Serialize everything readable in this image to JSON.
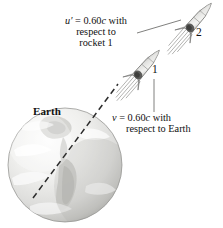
{
  "figure": {
    "background_color": "#ffffff",
    "width": 223,
    "height": 228
  },
  "labels": {
    "u_prime": {
      "line1_symbol": "u′",
      "line1": "u′ = 0.60c with",
      "line2": "respect to",
      "line3": "rocket 1",
      "full_text": "u′ = 0.60c with respect to rocket 1",
      "speed_value": "0.60c"
    },
    "v": {
      "line1": "v = 0.60c with",
      "line2": "respect to Earth",
      "full_text": "v = 0.60c with respect to Earth",
      "speed_value": "0.60c"
    },
    "earth": "Earth",
    "rocket1_number": "1",
    "rocket2_number": "2"
  },
  "objects": {
    "earth": {
      "name": "earth-sphere",
      "fill_light": "#f6f6f5",
      "fill_mid": "#dcdcda",
      "fill_shadow": "#bdbdbb",
      "outline_color": "#8c8c8a"
    },
    "rocket1": {
      "name": "rocket-1",
      "body_color": "#e8e8e6",
      "outline_color": "#6f6f6d",
      "nose_color": "#5c5c5a"
    },
    "rocket2": {
      "name": "rocket-2",
      "body_color": "#e8e8e6",
      "outline_color": "#6f6f6d",
      "nose_color": "#5c5c5a"
    },
    "trajectory_line": {
      "name": "dashed-trajectory-line",
      "style": "dashed",
      "color": "#2b2b2b"
    },
    "leader_line_uprime": {
      "name": "leader-line-u-prime",
      "color": "#555553"
    },
    "leader_line_v": {
      "name": "leader-line-v",
      "color": "#555553"
    }
  },
  "chart_data": {
    "type": "diagram",
    "entities": [
      "Earth",
      "rocket 1",
      "rocket 2"
    ],
    "velocities": [
      {
        "symbol": "v",
        "value": "0.60c",
        "of": "rocket 1",
        "reference_frame": "Earth"
      },
      {
        "symbol": "u′",
        "value": "0.60c",
        "of": "rocket 2",
        "reference_frame": "rocket 1"
      }
    ]
  }
}
